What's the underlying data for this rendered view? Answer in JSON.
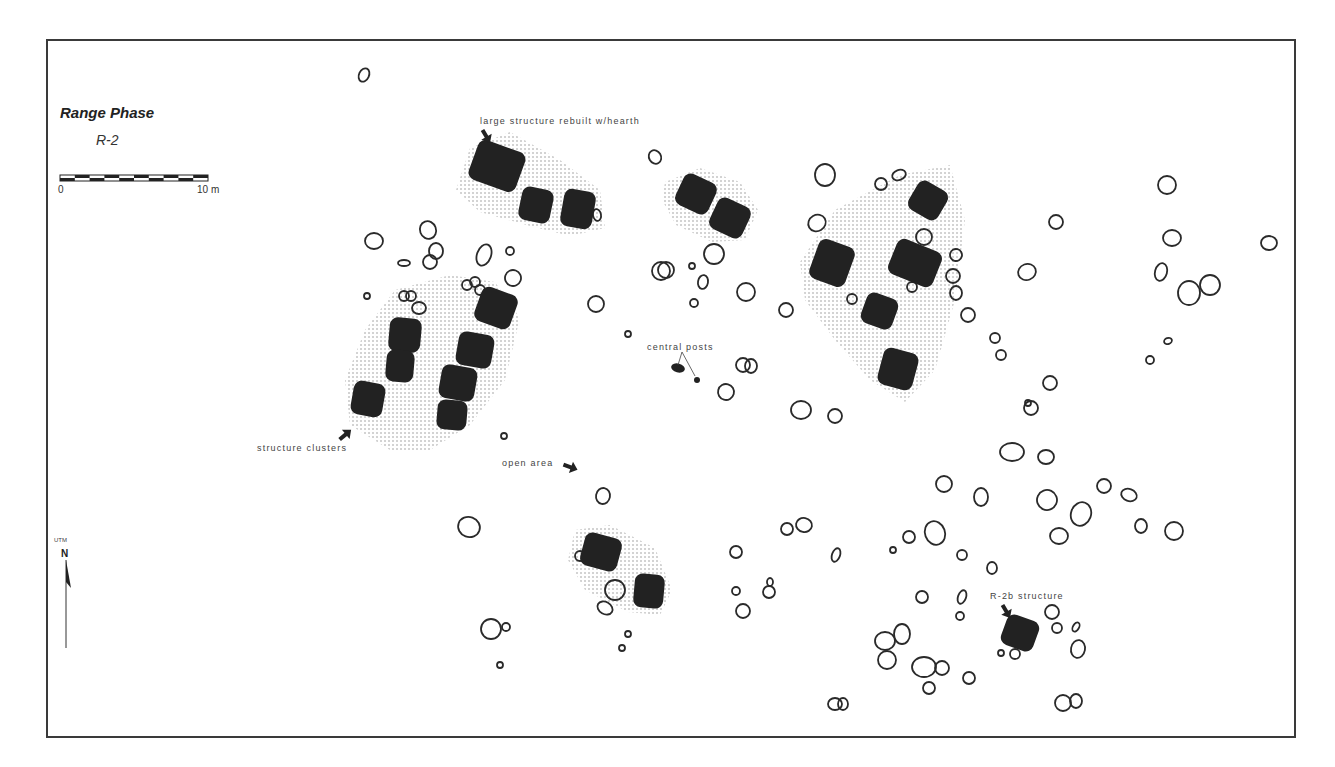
{
  "map": {
    "title": "Range Phase",
    "subtitle": "R-2",
    "scale": {
      "start_label": "0",
      "end_label": "10 m",
      "x1": 60,
      "x2": 208,
      "y": 178,
      "segments": 10
    },
    "north_arrow": {
      "system_label": "UTM",
      "label": "N",
      "x": 66,
      "y_top": 560,
      "y_bottom": 648
    },
    "colors": {
      "structure_fill": "#222222",
      "post_stroke": "#2a2a2a",
      "stipple": "#9a9a9a",
      "frame": "#3a3a3a",
      "text": "#444444"
    },
    "annotations": [
      {
        "id": "large-structure",
        "text": "large structure rebuilt w/hearth",
        "x": 480,
        "y": 116,
        "arrow": {
          "x": 486,
          "y": 136,
          "rot": 60
        }
      },
      {
        "id": "central-posts",
        "text": "central posts",
        "x": 647,
        "y": 343
      },
      {
        "id": "structure-clusters",
        "text": "structure clusters",
        "x": 257,
        "y": 443,
        "arrow": {
          "x": 345,
          "y": 435,
          "rot": -40
        }
      },
      {
        "id": "open-area",
        "text": "open area",
        "x": 502,
        "y": 459,
        "arrow": {
          "x": 570,
          "y": 467,
          "rot": 20
        }
      },
      {
        "id": "r2b-structure",
        "text": "R-2b structure",
        "x": 990,
        "y": 592,
        "arrow": {
          "x": 1006,
          "y": 611,
          "rot": 60
        }
      }
    ],
    "stipple_zones": [
      {
        "id": "zone-large-structure",
        "points": "470,148 510,132 560,160 600,190 605,228 570,236 530,226 480,212 456,190"
      },
      {
        "id": "zone-central-pair",
        "points": "665,182 700,168 740,182 758,210 745,240 712,242 676,225 662,200"
      },
      {
        "id": "zone-east-cluster",
        "points": "835,210 900,175 950,165 965,220 955,300 935,370 905,402 870,380 835,340 805,300 800,262"
      },
      {
        "id": "zone-west-cluster",
        "points": "395,290 450,275 495,282 520,318 505,380 470,425 430,450 390,450 350,425 345,380 365,330"
      },
      {
        "id": "zone-south-pair",
        "points": "575,530 610,525 655,548 672,590 660,615 628,612 585,590 568,560"
      }
    ],
    "structures": [
      {
        "id": "large-structure-rebuilt",
        "x": 472,
        "y": 145,
        "w": 50,
        "h": 42,
        "rot": 20
      },
      {
        "x": 520,
        "y": 188,
        "w": 32,
        "h": 34,
        "rot": 12
      },
      {
        "x": 562,
        "y": 190,
        "w": 32,
        "h": 38,
        "rot": 10
      },
      {
        "x": 678,
        "y": 177,
        "w": 36,
        "h": 34,
        "rot": 25
      },
      {
        "x": 712,
        "y": 201,
        "w": 36,
        "h": 34,
        "rot": 25
      },
      {
        "x": 911,
        "y": 184,
        "w": 34,
        "h": 33,
        "rot": 30
      },
      {
        "x": 813,
        "y": 242,
        "w": 38,
        "h": 42,
        "rot": 20
      },
      {
        "x": 891,
        "y": 244,
        "w": 48,
        "h": 38,
        "rot": 22
      },
      {
        "x": 863,
        "y": 295,
        "w": 33,
        "h": 32,
        "rot": 20
      },
      {
        "x": 880,
        "y": 350,
        "w": 36,
        "h": 38,
        "rot": 15
      },
      {
        "x": 477,
        "y": 290,
        "w": 38,
        "h": 36,
        "rot": 20
      },
      {
        "x": 389,
        "y": 318,
        "w": 32,
        "h": 34,
        "rot": 5
      },
      {
        "x": 386,
        "y": 350,
        "w": 28,
        "h": 32,
        "rot": 5
      },
      {
        "x": 457,
        "y": 333,
        "w": 36,
        "h": 34,
        "rot": 10
      },
      {
        "x": 440,
        "y": 366,
        "w": 36,
        "h": 34,
        "rot": 10
      },
      {
        "x": 437,
        "y": 400,
        "w": 30,
        "h": 30,
        "rot": 5
      },
      {
        "x": 352,
        "y": 382,
        "w": 32,
        "h": 34,
        "rot": 10
      },
      {
        "x": 582,
        "y": 535,
        "w": 38,
        "h": 34,
        "rot": 15
      },
      {
        "x": 634,
        "y": 574,
        "w": 30,
        "h": 34,
        "rot": 5
      },
      {
        "id": "r2b-structure",
        "x": 1003,
        "y": 617,
        "w": 34,
        "h": 32,
        "rot": 20
      }
    ],
    "central_posts": [
      {
        "cx": 678,
        "cy": 368,
        "rx": 7,
        "ry": 4.5,
        "rot": 15
      },
      {
        "cx": 697,
        "cy": 380,
        "rx": 3,
        "ry": 3,
        "rot": 0
      }
    ],
    "posts": [
      [
        364,
        75,
        5,
        7,
        25
      ],
      [
        655,
        157,
        6,
        7,
        -30
      ],
      [
        825,
        175,
        10,
        11,
        0
      ],
      [
        881,
        184,
        6,
        6,
        0
      ],
      [
        899,
        175,
        7,
        5,
        -20
      ],
      [
        374,
        241,
        9,
        8,
        0
      ],
      [
        428,
        230,
        8,
        9,
        -20
      ],
      [
        436,
        251,
        7,
        8,
        0
      ],
      [
        430,
        262,
        7,
        7,
        0
      ],
      [
        404,
        263,
        6,
        3,
        0
      ],
      [
        484,
        255,
        7,
        11,
        20
      ],
      [
        510,
        251,
        4,
        4,
        0
      ],
      [
        513,
        278,
        8,
        8,
        20
      ],
      [
        367,
        296,
        3,
        3,
        0
      ],
      [
        404,
        296,
        5,
        5,
        0
      ],
      [
        411,
        296,
        5,
        5,
        0
      ],
      [
        419,
        308,
        7,
        6,
        0
      ],
      [
        467,
        285,
        5,
        5,
        0
      ],
      [
        475,
        282,
        5,
        5,
        0
      ],
      [
        480,
        290,
        5,
        5,
        0
      ],
      [
        597,
        215,
        4,
        6,
        -10
      ],
      [
        661,
        271,
        9,
        9,
        0
      ],
      [
        666,
        270,
        8,
        8,
        0
      ],
      [
        692,
        266,
        3,
        3,
        0
      ],
      [
        714,
        254,
        10,
        10,
        0
      ],
      [
        703,
        282,
        5,
        7,
        10
      ],
      [
        694,
        303,
        4,
        4,
        0
      ],
      [
        746,
        292,
        9,
        9,
        0
      ],
      [
        596,
        304,
        8,
        8,
        0
      ],
      [
        628,
        334,
        3,
        3,
        0
      ],
      [
        786,
        310,
        7,
        7,
        0
      ],
      [
        852,
        299,
        5,
        5,
        0
      ],
      [
        912,
        287,
        5,
        5,
        0
      ],
      [
        817,
        223,
        9,
        8,
        -30
      ],
      [
        924,
        237,
        8,
        8,
        0
      ],
      [
        956,
        255,
        6,
        6,
        -30
      ],
      [
        953,
        276,
        7,
        7,
        0
      ],
      [
        956,
        293,
        6,
        7,
        0
      ],
      [
        968,
        315,
        7,
        7,
        0
      ],
      [
        995,
        338,
        5,
        5,
        0
      ],
      [
        1001,
        355,
        5,
        5,
        0
      ],
      [
        1056,
        222,
        7,
        7,
        0
      ],
      [
        1027,
        272,
        9,
        8,
        -20
      ],
      [
        1167,
        185,
        9,
        9,
        0
      ],
      [
        1172,
        238,
        9,
        8,
        0
      ],
      [
        1269,
        243,
        8,
        7,
        0
      ],
      [
        1161,
        272,
        6,
        9,
        15
      ],
      [
        1189,
        293,
        11,
        12,
        0
      ],
      [
        1210,
        285,
        10,
        10,
        0
      ],
      [
        1150,
        360,
        4,
        4,
        0
      ],
      [
        1168,
        341,
        4,
        3,
        -20
      ],
      [
        743,
        365,
        7,
        7,
        0
      ],
      [
        751,
        366,
        6,
        7,
        0
      ],
      [
        726,
        392,
        8,
        8,
        -30
      ],
      [
        801,
        410,
        10,
        9,
        0
      ],
      [
        835,
        416,
        7,
        7,
        0
      ],
      [
        1050,
        383,
        7,
        7,
        0
      ],
      [
        1031,
        408,
        7,
        7,
        0
      ],
      [
        1028,
        403,
        3,
        3,
        0
      ],
      [
        1012,
        452,
        12,
        9,
        0
      ],
      [
        1046,
        457,
        8,
        7,
        0
      ],
      [
        504,
        436,
        3,
        3,
        0
      ],
      [
        603,
        496,
        7,
        8,
        10
      ],
      [
        469,
        527,
        11,
        10,
        20
      ],
      [
        580,
        556,
        5,
        5,
        0
      ],
      [
        615,
        590,
        10,
        10,
        0
      ],
      [
        605,
        608,
        8,
        6,
        30
      ],
      [
        628,
        634,
        3,
        3,
        0
      ],
      [
        622,
        648,
        3,
        3,
        0
      ],
      [
        491,
        629,
        10,
        10,
        0
      ],
      [
        506,
        627,
        4,
        4,
        0
      ],
      [
        500,
        665,
        3,
        3,
        0
      ],
      [
        736,
        552,
        6,
        6,
        0
      ],
      [
        787,
        529,
        6,
        6,
        0
      ],
      [
        804,
        525,
        8,
        7,
        10
      ],
      [
        836,
        555,
        4,
        7,
        20
      ],
      [
        736,
        591,
        4,
        4,
        0
      ],
      [
        770,
        582,
        3,
        4,
        0
      ],
      [
        769,
        592,
        6,
        6,
        0
      ],
      [
        743,
        611,
        7,
        7,
        0
      ],
      [
        944,
        484,
        8,
        8,
        0
      ],
      [
        981,
        497,
        7,
        9,
        0
      ],
      [
        1047,
        500,
        10,
        10,
        -20
      ],
      [
        1104,
        486,
        7,
        7,
        0
      ],
      [
        1129,
        495,
        8,
        6,
        20
      ],
      [
        1081,
        514,
        10,
        12,
        20
      ],
      [
        1059,
        536,
        9,
        8,
        0
      ],
      [
        1141,
        526,
        6,
        7,
        0
      ],
      [
        1174,
        531,
        9,
        9,
        0
      ],
      [
        893,
        550,
        3,
        3,
        0
      ],
      [
        909,
        537,
        6,
        6,
        0
      ],
      [
        935,
        533,
        10,
        12,
        -20
      ],
      [
        962,
        555,
        5,
        5,
        0
      ],
      [
        992,
        568,
        5,
        6,
        0
      ],
      [
        922,
        597,
        6,
        6,
        0
      ],
      [
        962,
        597,
        4,
        7,
        20
      ],
      [
        960,
        616,
        4,
        4,
        0
      ],
      [
        1001,
        653,
        3,
        3,
        0
      ],
      [
        1015,
        654,
        5,
        5,
        0
      ],
      [
        1052,
        612,
        7,
        7,
        0
      ],
      [
        1057,
        628,
        5,
        5,
        0
      ],
      [
        1076,
        627,
        3,
        5,
        30
      ],
      [
        1078,
        649,
        7,
        9,
        10
      ],
      [
        885,
        641,
        10,
        9,
        0
      ],
      [
        902,
        634,
        8,
        10,
        0
      ],
      [
        887,
        660,
        9,
        9,
        0
      ],
      [
        924,
        667,
        12,
        10,
        0
      ],
      [
        942,
        668,
        7,
        7,
        0
      ],
      [
        929,
        688,
        6,
        6,
        0
      ],
      [
        969,
        678,
        6,
        6,
        0
      ],
      [
        835,
        704,
        7,
        6,
        0
      ],
      [
        843,
        704,
        5,
        6,
        0
      ],
      [
        1063,
        703,
        8,
        8,
        0
      ],
      [
        1076,
        701,
        6,
        7,
        0
      ]
    ]
  }
}
